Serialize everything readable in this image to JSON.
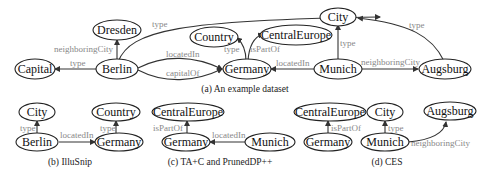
{
  "panels": {
    "a": {
      "caption": "(a) An example dataset",
      "nodes": {
        "dresden": "Dresden",
        "city": "City",
        "country": "Country",
        "centraleurope": "CentralEurope",
        "capital": "Capital",
        "berlin": "Berlin",
        "germany": "Germany",
        "munich": "Munich",
        "augsburg": "Augsburg"
      },
      "edges": {
        "berlin_dresden": "neighboringCity",
        "berlin_city": "type",
        "berlin_capital": "type",
        "berlin_germany_located": "locatedIn",
        "berlin_germany_capital": "capitalOf",
        "germany_country": "type",
        "germany_centraleurope": "isPartOf",
        "munich_germany": "locatedIn",
        "munich_city": "type",
        "munich_augsburg": "neighboringCity",
        "augsburg_city": "type"
      }
    },
    "b": {
      "caption": "(b) IlluSnip",
      "nodes": {
        "city": "City",
        "country": "Country",
        "berlin": "Berlin",
        "germany": "Germany"
      },
      "edges": {
        "berlin_city": "type",
        "germany_country": "type",
        "berlin_germany": "locatedIn"
      }
    },
    "c": {
      "caption": "(c) TA+C and PrunedDP++",
      "nodes": {
        "centraleurope": "CentralEurope",
        "germany": "Germany",
        "munich": "Munich"
      },
      "edges": {
        "germany_centraleurope": "isPartOf",
        "munich_germany": "locatedIn"
      }
    },
    "d": {
      "caption": "(d) CES",
      "nodes": {
        "centraleurope": "CentralEurope",
        "city": "City",
        "augsburg": "Augsburg",
        "germany": "Germany",
        "munich": "Munich"
      },
      "edges": {
        "germany_centraleurope": "isPartOf",
        "munich_city": "type",
        "munich_augsburg": "neighboringCity"
      }
    }
  }
}
